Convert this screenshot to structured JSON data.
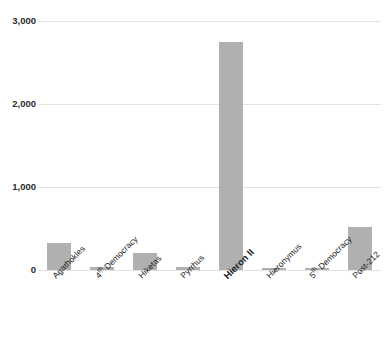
{
  "chart_data": {
    "type": "bar",
    "title": "",
    "title_note": "title row is cropped off the top edge of the screenshot; only letter descenders are visible",
    "xlabel": "",
    "ylabel": "",
    "ylim": [
      0,
      3000
    ],
    "ytick_labels": [
      "0",
      "1,000",
      "2,000",
      "3,000"
    ],
    "ytick_values": [
      0,
      1000,
      2000,
      3000
    ],
    "grid": true,
    "grid_axis": "y",
    "legend": false,
    "legend_position": "none",
    "bar_color": "#b0b0b0",
    "categories": [
      "Agathokles",
      "4th Democracy",
      "Hiketas",
      "Pyrrhus",
      "Hieron II",
      "Hieronymus",
      "5th Democracy",
      "Post-212"
    ],
    "values": [
      330,
      40,
      200,
      40,
      2750,
      25,
      25,
      520
    ],
    "emphasized_category": "Hieron II"
  },
  "axis": {
    "ticks": [
      {
        "label": "3,000",
        "value": 3000
      },
      {
        "label": "2,000",
        "value": 2000
      },
      {
        "label": "1,000",
        "value": 1000
      },
      {
        "label": "0",
        "value": 0
      }
    ]
  },
  "bars": [
    {
      "label": "Agathokles",
      "label_prefix": "Agathokles",
      "label_sup": "",
      "label_suffix": "",
      "value": 330,
      "emphasis": false
    },
    {
      "label": "4th Democracy",
      "label_prefix": "4",
      "label_sup": "th",
      "label_suffix": " Democracy",
      "value": 40,
      "emphasis": false
    },
    {
      "label": "Hiketas",
      "label_prefix": "Hiketas",
      "label_sup": "",
      "label_suffix": "",
      "value": 200,
      "emphasis": false
    },
    {
      "label": "Pyrrhus",
      "label_prefix": "Pyrrhus",
      "label_sup": "",
      "label_suffix": "",
      "value": 40,
      "emphasis": false
    },
    {
      "label": "Hieron II",
      "label_prefix": "Hieron II",
      "label_sup": "",
      "label_suffix": "",
      "value": 2750,
      "emphasis": true
    },
    {
      "label": "Hieronymus",
      "label_prefix": "Hieronymus",
      "label_sup": "",
      "label_suffix": "",
      "value": 25,
      "emphasis": false
    },
    {
      "label": "5th Democracy",
      "label_prefix": "5",
      "label_sup": "th",
      "label_suffix": " Democracy",
      "value": 25,
      "emphasis": false
    },
    {
      "label": "Post-212",
      "label_prefix": "Post-212",
      "label_sup": "",
      "label_suffix": "",
      "value": 520,
      "emphasis": false
    }
  ]
}
